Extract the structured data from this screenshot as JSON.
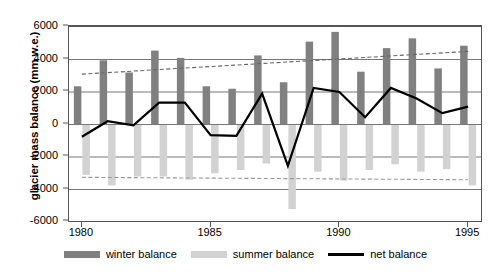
{
  "chart_data": {
    "type": "bar",
    "title": "",
    "xlabel": "",
    "ylabel": "glacier mass balance (mm w.e.)",
    "ylim": [
      -6000,
      6000
    ],
    "xlim": [
      1979.5,
      1995.5
    ],
    "grid": true,
    "legend_position": "bottom",
    "categories": [
      1980,
      1981,
      1982,
      1983,
      1984,
      1985,
      1986,
      1987,
      1988,
      1989,
      1990,
      1991,
      1992,
      1993,
      1994,
      1995
    ],
    "yticks": [
      6000,
      4000,
      2000,
      0,
      -2000,
      -4000,
      -6000
    ],
    "xticks": [
      1980,
      1985,
      1990,
      1995
    ],
    "series": [
      {
        "name": "winter balance",
        "type": "bar",
        "color": "#808080",
        "values": [
          2350,
          3950,
          3200,
          4550,
          4100,
          2350,
          2200,
          4250,
          2600,
          5100,
          5700,
          3250,
          4700,
          5300,
          3450,
          4850
        ]
      },
      {
        "name": "summer balance",
        "type": "bar",
        "color": "#d2d2d2",
        "values": [
          -3100,
          -3750,
          -3200,
          -3200,
          -3400,
          -3000,
          -2800,
          -2400,
          -5200,
          -2900,
          -3450,
          -2800,
          -2450,
          -2900,
          -2750,
          -3750
        ]
      },
      {
        "name": "net balance",
        "type": "line",
        "color": "#000000",
        "values": [
          -750,
          200,
          -50,
          1350,
          1350,
          -650,
          -700,
          1900,
          -2550,
          2250,
          2000,
          450,
          2250,
          1600,
          700,
          1100
        ]
      }
    ],
    "trendlines": [
      {
        "name": "winter balance trend",
        "style": "dashed",
        "color": "#666666",
        "start": [
          1980,
          3100
        ],
        "end": [
          1995,
          4500
        ]
      },
      {
        "name": "summer balance trend",
        "style": "dashed",
        "color": "#999999",
        "start": [
          1980,
          -3250
        ],
        "end": [
          1995,
          -3400
        ]
      }
    ]
  },
  "axis": {
    "y_title": "glacier mass balance (mm w.e.)",
    "y_tick_labels": [
      "6000",
      "4000",
      "2000",
      "0",
      "-2000",
      "-4000",
      "-6000"
    ],
    "x_tick_labels": [
      "1980",
      "1985",
      "1990",
      "1995"
    ]
  },
  "legend": {
    "entries": [
      {
        "label": "winter balance",
        "marker": "bar-swatch",
        "color": "#808080"
      },
      {
        "label": "summer balance",
        "marker": "bar-swatch",
        "color": "#d2d2d2"
      },
      {
        "label": "net balance",
        "marker": "line-swatch",
        "color": "#000000"
      }
    ]
  }
}
